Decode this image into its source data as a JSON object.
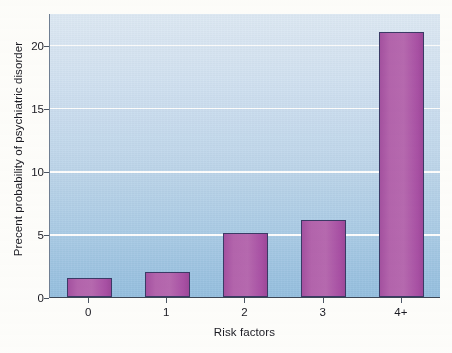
{
  "chart_data": {
    "type": "bar",
    "title": "",
    "subtitle": "",
    "xlabel": "Risk factors",
    "ylabel": "Precent probability of psychiatric disorder",
    "categories": [
      "0",
      "1",
      "2",
      "3",
      "4+"
    ],
    "values": [
      1.5,
      2.0,
      5.1,
      6.1,
      21.0
    ],
    "series": [
      {
        "name": "Percent probability of psychiatric disorder",
        "values": [
          1.5,
          2.0,
          5.1,
          6.1,
          21.0
        ]
      }
    ],
    "ylim": [
      0,
      22.5
    ],
    "yticks": [
      0,
      5,
      10,
      15,
      20
    ],
    "ytick_labels": [
      "0",
      "5",
      "10",
      "15",
      "20"
    ],
    "xtick_labels": [
      "0",
      "1",
      "2",
      "3",
      "4+"
    ],
    "grid": "horizontal",
    "gridline_color": "#ffffff",
    "legend": "none",
    "bar_color": "#a855a0",
    "bar_edge_color": "#3b3a66",
    "plot_background_top": "#dde9f5",
    "plot_background_bottom": "#95bfe0",
    "axis_color": "#3c4654",
    "text_color": "#1a1a22"
  }
}
